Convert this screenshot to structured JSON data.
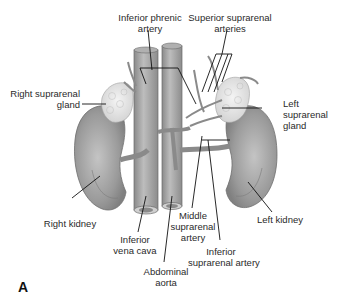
{
  "figure": {
    "panel_letter": "A",
    "labels": {
      "inferior_phrenic_artery": {
        "line1": "Inferior phrenic",
        "line2": "artery"
      },
      "superior_suprarenal_arteries": {
        "line1": "Superior suprarenal",
        "line2": "arteries"
      },
      "right_suprarenal_gland": {
        "line1": "Right suprarenal",
        "line2": "gland"
      },
      "left_suprarenal_gland": {
        "line1": "Left",
        "line2": "suprarenal",
        "line3": "gland"
      },
      "right_kidney": {
        "line1": "Right kidney"
      },
      "left_kidney": {
        "line1": "Left kidney"
      },
      "inferior_vena_cava": {
        "line1": "Inferior",
        "line2": "vena cava"
      },
      "abdominal_aorta": {
        "line1": "Abdominal",
        "line2": "aorta"
      },
      "middle_suprarenal_artery": {
        "line1": "Middle",
        "line2": "suprarenal",
        "line3": "artery"
      },
      "inferior_suprarenal_artery": {
        "line1": "Inferior",
        "line2": "suprarenal artery"
      }
    },
    "colors": {
      "organ_fill": "#9a9a9a",
      "organ_light": "#c8c8c8",
      "gland_fill": "#e6e6e6",
      "vessel_fill": "#a8a8a8",
      "leader_line": "#111111",
      "text": "#2a2a2a"
    }
  }
}
